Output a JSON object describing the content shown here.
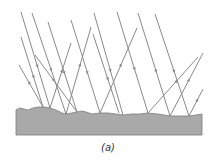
{
  "figure": {
    "caption": "(a)",
    "colors": {
      "ray": "#8a8a8a",
      "surface_fill": "#a9a9a9",
      "surface_edge": "#7c7c7c",
      "background": "#ffffff"
    },
    "surface": {
      "top_profile": [
        [
          16,
          110
        ],
        [
          20,
          108
        ],
        [
          24,
          109
        ],
        [
          28,
          110
        ],
        [
          33,
          108
        ],
        [
          38,
          107
        ],
        [
          44,
          107
        ],
        [
          50,
          108
        ],
        [
          56,
          110
        ],
        [
          62,
          113
        ],
        [
          66,
          114
        ],
        [
          72,
          113
        ],
        [
          77,
          112
        ],
        [
          82,
          111
        ],
        [
          86,
          112
        ],
        [
          92,
          114
        ],
        [
          100,
          113
        ],
        [
          108,
          113
        ],
        [
          116,
          114
        ],
        [
          123,
          115
        ],
        [
          132,
          114
        ],
        [
          140,
          114
        ],
        [
          148,
          113
        ],
        [
          158,
          114
        ],
        [
          170,
          116
        ],
        [
          180,
          116
        ],
        [
          189,
          116
        ],
        [
          196,
          115
        ],
        [
          202,
          114
        ]
      ],
      "bottom": 135,
      "left": 16,
      "right": 202
    },
    "incident_rays": [
      {
        "x1": 21,
        "y1": 12,
        "x2": 50,
        "y2": 108
      },
      {
        "x1": 32,
        "y1": 13,
        "x2": 66,
        "y2": 114
      },
      {
        "x1": 48,
        "y1": 22,
        "x2": 77,
        "y2": 112
      },
      {
        "x1": 71,
        "y1": 20,
        "x2": 100,
        "y2": 113
      },
      {
        "x1": 94,
        "y1": 13,
        "x2": 123,
        "y2": 115
      },
      {
        "x1": 117,
        "y1": 12,
        "x2": 148,
        "y2": 113
      },
      {
        "x1": 138,
        "y1": 13,
        "x2": 170,
        "y2": 116
      },
      {
        "x1": 155,
        "y1": 14,
        "x2": 189,
        "y2": 116
      },
      {
        "x1": 21,
        "y1": 37,
        "x2": 43,
        "y2": 107
      },
      {
        "x1": 93,
        "y1": 34,
        "x2": 119,
        "y2": 113
      }
    ],
    "reflected_rays": [
      {
        "x1": 50,
        "y1": 108,
        "x2": 71,
        "y2": 43
      },
      {
        "x1": 66,
        "y1": 114,
        "x2": 91,
        "y2": 27
      },
      {
        "x1": 100,
        "y1": 113,
        "x2": 137,
        "y2": 28
      },
      {
        "x1": 148,
        "y1": 113,
        "x2": 198,
        "y2": 57
      },
      {
        "x1": 170,
        "y1": 116,
        "x2": 203,
        "y2": 53
      },
      {
        "x1": 189,
        "y1": 116,
        "x2": 203,
        "y2": 89
      },
      {
        "x1": 43,
        "y1": 107,
        "x2": 19,
        "y2": 65
      },
      {
        "x1": 77,
        "y1": 112,
        "x2": 35,
        "y2": 55
      }
    ]
  }
}
